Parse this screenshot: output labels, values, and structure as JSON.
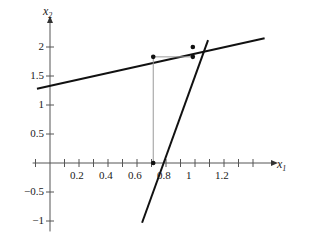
{
  "chart_data": {
    "type": "line",
    "title": "",
    "xlabel": "x_1",
    "ylabel": "x_2",
    "xlim": [
      -0.12,
      1.52
    ],
    "ylim": [
      -1.18,
      2.32
    ],
    "grid": false,
    "legend": null,
    "x_ticks_major": [
      0.2,
      0.4,
      0.6,
      0.8,
      1,
      1.2
    ],
    "x_tick_labels": [
      "0.2",
      "0.4",
      "0.6",
      "0.8",
      "1",
      "1.2"
    ],
    "x_ticks_minor": [
      -0.1,
      0.1,
      0.3,
      0.5,
      0.7,
      0.9,
      1.1,
      1.3,
      1.4
    ],
    "y_ticks_major": [
      2,
      1.5,
      1,
      0.5,
      -0.5,
      -1
    ],
    "y_tick_labels": [
      "2",
      "1.5",
      "1",
      "0.5",
      "−0.5",
      "−1"
    ],
    "series": [
      {
        "name": "shallow-line",
        "type": "line",
        "color": "#111111",
        "width": 2.0,
        "points": [
          [
            -0.09,
            1.28
          ],
          [
            1.48,
            2.15
          ]
        ]
      },
      {
        "name": "steep-line",
        "type": "line",
        "color": "#111111",
        "width": 2.0,
        "points": [
          [
            0.635,
            -1.03
          ],
          [
            1.09,
            2.12
          ]
        ]
      },
      {
        "name": "helper-vertical",
        "type": "line",
        "color": "#9a9a9a",
        "width": 1.0,
        "points": [
          [
            0.712,
            0.0
          ],
          [
            0.712,
            1.83
          ]
        ]
      },
      {
        "name": "helper-horizontal",
        "type": "line",
        "color": "#9a9a9a",
        "width": 1.0,
        "points": [
          [
            0.712,
            1.83
          ],
          [
            0.985,
            1.83
          ]
        ]
      }
    ],
    "markers": [
      {
        "name": "point-left",
        "x": 0.712,
        "y": 1.83,
        "color": "#111111",
        "r": 2.3
      },
      {
        "name": "point-intersection",
        "x": 0.985,
        "y": 2.0,
        "color": "#111111",
        "r": 2.3
      },
      {
        "name": "point-right-lower",
        "x": 0.985,
        "y": 1.83,
        "color": "#111111",
        "r": 2.3
      },
      {
        "name": "point-root",
        "x": 0.712,
        "y": 0.0,
        "color": "#111111",
        "r": 2.3
      }
    ]
  },
  "labels": {
    "x_axis_base": "x",
    "x_axis_sub": "1",
    "y_axis_base": "x",
    "y_axis_sub": "2"
  }
}
